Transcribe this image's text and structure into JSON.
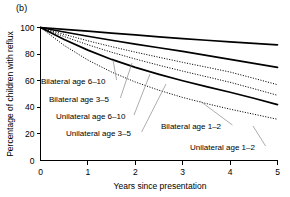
{
  "panel": {
    "label": "(b)"
  },
  "chart_data": {
    "type": "line",
    "title": "",
    "xlabel": "Years since presentation",
    "ylabel": "Percentage of children with reflux",
    "xlim": [
      0,
      5
    ],
    "ylim": [
      0,
      100
    ],
    "xticks": [
      0,
      1,
      2,
      3,
      4,
      5
    ],
    "yticks": [
      0,
      20,
      40,
      60,
      80,
      100
    ],
    "xtick_labels": [
      "0",
      "1",
      "2",
      "3",
      "4",
      "5"
    ],
    "ytick_labels": [
      "0",
      "20",
      "40",
      "60",
      "80",
      "100"
    ],
    "grid": false,
    "legend_position": "inline-annotations",
    "x": [
      0,
      0.5,
      1,
      1.5,
      2,
      2.5,
      3,
      3.5,
      4,
      4.5,
      5
    ],
    "series": [
      {
        "name": "Bilateral age 6-10",
        "label": "Bilateral age 6–10",
        "style": "solid",
        "color": "#000000",
        "values": [
          100,
          98.6,
          97.2,
          95.8,
          94.4,
          93.0,
          91.6,
          90.4,
          89.2,
          88.0,
          87.0
        ]
      },
      {
        "name": "Bilateral age 3-5",
        "label": "Bilateral age 3–5",
        "style": "solid",
        "color": "#000000",
        "values": [
          100,
          96.6,
          93.4,
          90.4,
          87.5,
          84.8,
          82.0,
          79.0,
          76.0,
          73.0,
          70.0
        ]
      },
      {
        "name": "Unilateral age 6-10",
        "label": "Unilateral age 6–10",
        "style": "dotted",
        "color": "#000000",
        "values": [
          100,
          94.8,
          90.0,
          85.6,
          81.5,
          77.6,
          73.8,
          70.2,
          66.5,
          61.8,
          57.0
        ]
      },
      {
        "name": "Unilateral age 3-5",
        "label": "Unilateral age 3–5",
        "style": "dotted",
        "color": "#000000",
        "values": [
          100,
          93.2,
          87.0,
          81.4,
          76.3,
          71.6,
          67.2,
          63.0,
          58.8,
          54.0,
          49.0
        ]
      },
      {
        "name": "Bilateral age 1-2",
        "label": "Bilateral age 1–2",
        "style": "solid",
        "color": "#000000",
        "values": [
          100,
          91.0,
          83.0,
          76.0,
          70.0,
          64.8,
          60.0,
          55.5,
          51.3,
          46.8,
          42.0
        ]
      },
      {
        "name": "Unilateral age 1-2",
        "label": "Unilateral age 1–2",
        "style": "dotted",
        "color": "#000000",
        "values": [
          100,
          86.5,
          75.5,
          66.5,
          59.0,
          52.8,
          47.4,
          42.8,
          38.6,
          34.8,
          31.0
        ]
      }
    ],
    "annotations": [
      {
        "text": "Bilateral age 6–10",
        "x_px": 41,
        "y_px": 84,
        "anchor": "start",
        "leader_to_x": 113,
        "leader_to_y": 60
      },
      {
        "text": "Bilateral age 3–5",
        "x_px": 49,
        "y_px": 102,
        "anchor": "start",
        "leader_to_x": 132,
        "leader_to_y": 63
      },
      {
        "text": "Unilateral age 6–10",
        "x_px": 56,
        "y_px": 119,
        "anchor": "start",
        "leader_to_x": 150,
        "leader_to_y": 74
      },
      {
        "text": "Unilateral age 3–5",
        "x_px": 66,
        "y_px": 136,
        "anchor": "start",
        "leader_to_x": 166,
        "leader_to_y": 84
      },
      {
        "text": "Bilateral age 1–2",
        "x_px": 161,
        "y_px": 129,
        "anchor": "start",
        "leader_to_x": 200,
        "leader_to_y": 101
      },
      {
        "text": "Unilateral age 1–2",
        "x_px": 190,
        "y_px": 150,
        "anchor": "start",
        "leader_to_x": 253,
        "leader_to_y": 126
      }
    ]
  }
}
